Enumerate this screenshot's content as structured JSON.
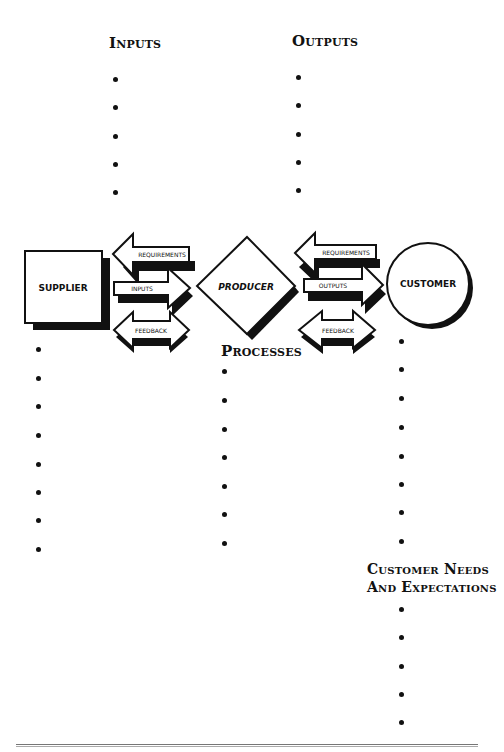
{
  "headings": {
    "inputs": "Inputs",
    "outputs": "Outputs",
    "processes": "Processes",
    "customer_needs_line1": "Customer Needs",
    "customer_needs_line2": "And Expectations"
  },
  "nodes": {
    "supplier": "SUPPLIER",
    "producer": "PRODUCER",
    "customer": "CUSTOMER"
  },
  "arrows": {
    "left_group": {
      "requirements": "REQUIREMENTS",
      "inputs": "INPUTS",
      "feedback": "FEEDBACK"
    },
    "right_group": {
      "requirements": "REQUIREMENTS",
      "outputs": "OUTPUTS",
      "feedback": "FEEDBACK"
    }
  },
  "bullet_lists": {
    "inputs": [
      "",
      "",
      "",
      "",
      ""
    ],
    "outputs": [
      "",
      "",
      "",
      "",
      ""
    ],
    "supplier": [
      "",
      "",
      "",
      "",
      "",
      "",
      "",
      ""
    ],
    "processes": [
      "",
      "",
      "",
      "",
      "",
      "",
      ""
    ],
    "customer": [
      "",
      "",
      "",
      "",
      "",
      "",
      "",
      ""
    ],
    "customer_needs": [
      "",
      "",
      "",
      "",
      ""
    ]
  },
  "colors": {
    "ink": "#111111",
    "background": "#ffffff"
  }
}
